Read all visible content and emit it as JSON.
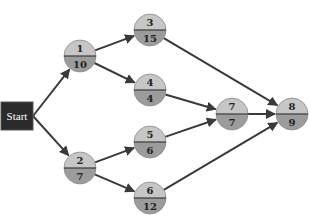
{
  "diagram": {
    "type": "activity-network",
    "start": {
      "label": "Start",
      "x": 17,
      "y": 116
    },
    "nodes": [
      {
        "id": "1",
        "activity": "1",
        "duration": "10",
        "x": 80,
        "y": 56
      },
      {
        "id": "2",
        "activity": "2",
        "duration": "7",
        "x": 80,
        "y": 168
      },
      {
        "id": "3",
        "activity": "3",
        "duration": "15",
        "x": 150,
        "y": 30
      },
      {
        "id": "4",
        "activity": "4",
        "duration": "4",
        "x": 150,
        "y": 90
      },
      {
        "id": "5",
        "activity": "5",
        "duration": "6",
        "x": 150,
        "y": 142
      },
      {
        "id": "6",
        "activity": "6",
        "duration": "12",
        "x": 150,
        "y": 198
      },
      {
        "id": "7",
        "activity": "7",
        "duration": "7",
        "x": 232,
        "y": 114
      },
      {
        "id": "8",
        "activity": "8",
        "duration": "9",
        "x": 292,
        "y": 114
      }
    ],
    "edges": [
      {
        "from": "Start",
        "to": "1"
      },
      {
        "from": "Start",
        "to": "2"
      },
      {
        "from": "1",
        "to": "3"
      },
      {
        "from": "1",
        "to": "4"
      },
      {
        "from": "2",
        "to": "5"
      },
      {
        "from": "2",
        "to": "6"
      },
      {
        "from": "3",
        "to": "8"
      },
      {
        "from": "4",
        "to": "7"
      },
      {
        "from": "5",
        "to": "7"
      },
      {
        "from": "7",
        "to": "8"
      },
      {
        "from": "6",
        "to": "8"
      }
    ],
    "colors": {
      "node_top": "#c6c6c6",
      "node_bottom": "#9c9c9c",
      "edge": "#3a3a3a",
      "start_fill": "#2b2b2b",
      "start_text": "#ffffff"
    }
  }
}
